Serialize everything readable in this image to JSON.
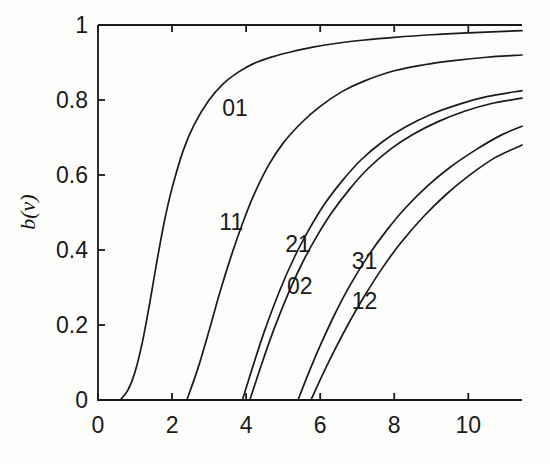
{
  "figure": {
    "background_color": "#fdfdfb",
    "line_color": "#1a1a1a",
    "axis_color": "#1a1a1a"
  },
  "axes": {
    "y_title": "b(v)",
    "x_ticks": [
      "0",
      "2",
      "4",
      "6",
      "8",
      "10"
    ],
    "y_ticks": [
      "0",
      "0.2",
      "0.4",
      "0.6",
      "0.8",
      "1"
    ]
  },
  "chart_data": {
    "type": "line",
    "title": "",
    "xlabel": "",
    "ylabel": "b(v)",
    "xlim": [
      0,
      11.45
    ],
    "ylim": [
      0,
      1
    ],
    "xticks": [
      0,
      2,
      4,
      6,
      8,
      10
    ],
    "yticks": [
      0,
      0.2,
      0.4,
      0.6,
      0.8,
      1
    ],
    "grid": false,
    "legend": "inline-curve-labels",
    "annotations": [
      {
        "text": "01",
        "x": 3.7,
        "y": 0.78
      },
      {
        "text": "11",
        "x": 3.6,
        "y": 0.475
      },
      {
        "text": "21",
        "x": 5.4,
        "y": 0.415
      },
      {
        "text": "02",
        "x": 5.45,
        "y": 0.305
      },
      {
        "text": "31",
        "x": 7.2,
        "y": 0.37
      },
      {
        "text": "12",
        "x": 7.2,
        "y": 0.265
      }
    ],
    "series": [
      {
        "name": "01",
        "onset": 0.6,
        "end_value": 0.985,
        "x": [
          0.6,
          0.8,
          1.0,
          1.2,
          1.4,
          1.6,
          1.8,
          2.0,
          2.3,
          2.6,
          3.0,
          3.4,
          3.8,
          4.2,
          4.7,
          5.2,
          5.8,
          6.5,
          7.2,
          8.0,
          9.0,
          10.0,
          11.45
        ],
        "y": [
          0.0,
          0.025,
          0.075,
          0.155,
          0.26,
          0.375,
          0.48,
          0.565,
          0.665,
          0.735,
          0.8,
          0.845,
          0.875,
          0.897,
          0.915,
          0.928,
          0.941,
          0.952,
          0.96,
          0.967,
          0.974,
          0.979,
          0.985
        ]
      },
      {
        "name": "11",
        "onset": 2.4,
        "end_value": 0.92,
        "x": [
          2.4,
          2.7,
          3.0,
          3.3,
          3.6,
          3.9,
          4.2,
          4.6,
          5.0,
          5.5,
          6.0,
          6.6,
          7.2,
          8.0,
          8.8,
          9.6,
          10.5,
          11.45
        ],
        "y": [
          0.0,
          0.085,
          0.185,
          0.29,
          0.385,
          0.47,
          0.545,
          0.625,
          0.685,
          0.74,
          0.783,
          0.823,
          0.851,
          0.878,
          0.894,
          0.905,
          0.914,
          0.92
        ]
      },
      {
        "name": "21",
        "onset": 3.9,
        "end_value": 0.825,
        "x": [
          3.9,
          4.2,
          4.5,
          4.9,
          5.3,
          5.7,
          6.1,
          6.6,
          7.1,
          7.7,
          8.3,
          9.0,
          9.7,
          10.5,
          11.45
        ],
        "y": [
          0.0,
          0.095,
          0.185,
          0.29,
          0.38,
          0.455,
          0.52,
          0.585,
          0.64,
          0.69,
          0.728,
          0.762,
          0.787,
          0.809,
          0.825
        ]
      },
      {
        "name": "02",
        "onset": 4.1,
        "end_value": 0.805,
        "x": [
          4.1,
          4.4,
          4.7,
          5.1,
          5.5,
          5.9,
          6.3,
          6.8,
          7.3,
          7.9,
          8.5,
          9.2,
          9.9,
          10.6,
          11.45
        ],
        "y": [
          0.0,
          0.09,
          0.175,
          0.275,
          0.362,
          0.435,
          0.498,
          0.563,
          0.618,
          0.669,
          0.708,
          0.743,
          0.77,
          0.79,
          0.805
        ]
      },
      {
        "name": "31",
        "onset": 5.4,
        "end_value": 0.73,
        "x": [
          5.4,
          5.7,
          6.0,
          6.4,
          6.8,
          7.3,
          7.8,
          8.3,
          8.9,
          9.5,
          10.2,
          10.9,
          11.45
        ],
        "y": [
          0.0,
          0.075,
          0.145,
          0.23,
          0.305,
          0.385,
          0.453,
          0.512,
          0.571,
          0.62,
          0.667,
          0.707,
          0.73
        ]
      },
      {
        "name": "12",
        "onset": 5.75,
        "end_value": 0.68,
        "x": [
          5.75,
          6.1,
          6.4,
          6.8,
          7.2,
          7.7,
          8.2,
          8.8,
          9.4,
          10.0,
          10.7,
          11.45
        ],
        "y": [
          0.0,
          0.075,
          0.135,
          0.21,
          0.278,
          0.355,
          0.422,
          0.49,
          0.548,
          0.597,
          0.645,
          0.68
        ]
      }
    ]
  }
}
